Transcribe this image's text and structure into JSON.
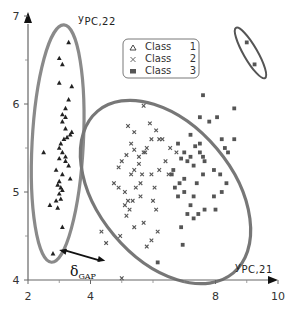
{
  "chart_data": {
    "type": "scatter",
    "title": "",
    "xlabel": "y_PC,21",
    "ylabel": "y_PC,22",
    "xlim": [
      2,
      10
    ],
    "ylim": [
      4,
      7
    ],
    "xticks": [
      "2",
      "4",
      "8",
      "10"
    ],
    "yticks": [
      "4",
      "5",
      "6",
      "7"
    ],
    "grid": false,
    "legend_position": "top-center",
    "legend": [
      "Class 1",
      "Class 2",
      "Class 3"
    ],
    "annotation": {
      "label": "δ",
      "sub": "GAP",
      "from": [
        2.9,
        4.34
      ],
      "to": [
        4.6,
        4.22
      ]
    },
    "series": [
      {
        "name": "Class 1",
        "marker": "triangle",
        "points": [
          [
            3.3,
            6.7
          ],
          [
            3.0,
            6.52
          ],
          [
            3.1,
            6.45
          ],
          [
            3.0,
            6.24
          ],
          [
            3.4,
            6.2
          ],
          [
            3.3,
            6.05
          ],
          [
            3.2,
            5.95
          ],
          [
            3.1,
            5.88
          ],
          [
            3.2,
            5.85
          ],
          [
            3.1,
            5.8
          ],
          [
            3.2,
            5.72
          ],
          [
            3.35,
            5.65
          ],
          [
            3.25,
            5.62
          ],
          [
            3.4,
            5.68
          ],
          [
            3.15,
            5.6
          ],
          [
            3.05,
            5.55
          ],
          [
            3.0,
            5.5
          ],
          [
            3.1,
            5.45
          ],
          [
            3.2,
            5.4
          ],
          [
            2.5,
            5.45
          ],
          [
            3.0,
            5.38
          ],
          [
            3.2,
            5.35
          ],
          [
            3.3,
            5.3
          ],
          [
            2.9,
            5.25
          ],
          [
            3.1,
            5.2
          ],
          [
            3.35,
            5.15
          ],
          [
            3.0,
            5.12
          ],
          [
            2.95,
            5.08
          ],
          [
            3.05,
            5.05
          ],
          [
            3.1,
            5.02
          ],
          [
            3.0,
            4.98
          ],
          [
            2.9,
            4.9
          ],
          [
            3.05,
            4.92
          ],
          [
            2.7,
            4.85
          ],
          [
            2.95,
            4.82
          ],
          [
            3.1,
            4.6
          ],
          [
            2.8,
            4.3
          ]
        ]
      },
      {
        "name": "Class 2",
        "marker": "x",
        "points": [
          [
            5.7,
            5.98
          ],
          [
            5.2,
            5.75
          ],
          [
            5.4,
            5.68
          ],
          [
            5.9,
            5.78
          ],
          [
            5.3,
            5.55
          ],
          [
            5.4,
            5.48
          ],
          [
            5.15,
            5.42
          ],
          [
            5.7,
            5.45
          ],
          [
            5.0,
            5.35
          ],
          [
            4.9,
            5.28
          ],
          [
            5.4,
            5.25
          ],
          [
            5.75,
            5.45
          ],
          [
            5.55,
            5.32
          ],
          [
            4.75,
            5.1
          ],
          [
            4.9,
            5.05
          ],
          [
            5.1,
            5.0
          ],
          [
            5.3,
            5.2
          ],
          [
            5.6,
            5.1
          ],
          [
            5.45,
            5.05
          ],
          [
            5.95,
            5.2
          ],
          [
            5.2,
            4.9
          ],
          [
            5.1,
            4.85
          ],
          [
            5.6,
            4.95
          ],
          [
            5.25,
            4.8
          ],
          [
            5.7,
            4.65
          ],
          [
            6.0,
            4.9
          ],
          [
            6.1,
            4.8
          ],
          [
            5.4,
            4.6
          ],
          [
            4.5,
            4.42
          ],
          [
            5.0,
            4.02
          ],
          [
            6.2,
            5.6
          ],
          [
            6.1,
            5.7
          ],
          [
            6.3,
            5.6
          ],
          [
            5.8,
            5.5
          ],
          [
            6.4,
            5.35
          ],
          [
            6.2,
            5.25
          ],
          [
            6.5,
            5.2
          ],
          [
            4.35,
            4.55
          ],
          [
            4.95,
            4.5
          ],
          [
            5.15,
            4.73
          ],
          [
            5.35,
            4.9
          ],
          [
            5.55,
            5.4
          ],
          [
            5.95,
            5.6
          ],
          [
            6.05,
            5.05
          ],
          [
            5.65,
            5.2
          ],
          [
            5.95,
            4.45
          ],
          [
            6.15,
            4.55
          ],
          [
            5.8,
            4.38
          ],
          [
            6.55,
            5.5
          ],
          [
            6.75,
            5.45
          ]
        ]
      },
      {
        "name": "Class 3",
        "marker": "square",
        "points": [
          [
            7.6,
            6.1
          ],
          [
            7.5,
            5.85
          ],
          [
            7.8,
            5.8
          ],
          [
            8.2,
            5.6
          ],
          [
            8.3,
            5.5
          ],
          [
            7.2,
            5.65
          ],
          [
            6.8,
            5.55
          ],
          [
            7.2,
            5.4
          ],
          [
            7.0,
            5.45
          ],
          [
            7.35,
            5.52
          ],
          [
            7.5,
            5.45
          ],
          [
            7.65,
            5.35
          ],
          [
            7.3,
            5.3
          ],
          [
            7.6,
            5.4
          ],
          [
            6.9,
            5.38
          ],
          [
            7.1,
            5.35
          ],
          [
            6.6,
            5.2
          ],
          [
            6.85,
            5.1
          ],
          [
            6.7,
            5.05
          ],
          [
            7.0,
            5.0
          ],
          [
            6.8,
            4.95
          ],
          [
            7.4,
            5.1
          ],
          [
            7.6,
            5.2
          ],
          [
            7.95,
            5.25
          ],
          [
            8.2,
            5.0
          ],
          [
            7.95,
            4.95
          ],
          [
            8.6,
            5.6
          ],
          [
            8.4,
            5.45
          ],
          [
            8.15,
            5.2
          ],
          [
            8.35,
            5.1
          ],
          [
            7.3,
            4.95
          ],
          [
            7.1,
            4.75
          ],
          [
            6.9,
            4.6
          ],
          [
            6.95,
            4.4
          ],
          [
            7.65,
            4.8
          ],
          [
            7.45,
            4.75
          ],
          [
            8.0,
            4.8
          ],
          [
            7.2,
            4.85
          ],
          [
            6.15,
            4.2
          ],
          [
            7.3,
            4.7
          ],
          [
            8.05,
            5.85
          ],
          [
            8.6,
            5.95
          ],
          [
            6.65,
            5.25
          ],
          [
            7.0,
            5.15
          ],
          [
            7.5,
            5.55
          ],
          [
            9.0,
            6.7
          ],
          [
            9.25,
            6.45
          ]
        ]
      }
    ],
    "ellipses": [
      {
        "cx": 2.95,
        "cy": 5.55,
        "rx": 0.82,
        "ry": 1.35,
        "angle": 3,
        "color": "#8a8a8a"
      },
      {
        "cx": 6.4,
        "cy": 5.0,
        "rx": 2.15,
        "ry": 1.2,
        "angle": -40,
        "color": "#777777"
      },
      {
        "cx": 9.12,
        "cy": 6.58,
        "rx": 0.22,
        "ry": 0.33,
        "angle": -30,
        "color": "#555555"
      }
    ]
  },
  "axes": {
    "x_label_main": "y",
    "x_label_sub": "PC,21",
    "y_label_main": "y",
    "y_label_sub": "PC,22"
  },
  "legend_items": [
    {
      "marker": "△",
      "label": "Class",
      "num": "1"
    },
    {
      "marker": "×",
      "label": "Class",
      "num": "2"
    },
    {
      "marker": "■",
      "label": "Class",
      "num": "3"
    }
  ],
  "gap": {
    "main": "δ",
    "sub": "GAP"
  }
}
